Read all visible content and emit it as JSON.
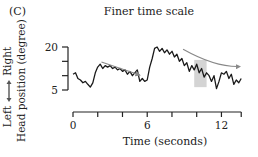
{
  "panel_label": "(C)",
  "chart_data": {
    "type": "line",
    "title": "Finer time scale",
    "xlabel": "Time (seconds)",
    "ylabel": "Head position (degree)",
    "ylabel_direction": {
      "low": "Left",
      "high": "Right"
    },
    "xlim": [
      0,
      13.6
    ],
    "ylim": [
      5,
      20
    ],
    "x_ticks": [
      0,
      2,
      4,
      6,
      8,
      10,
      12
    ],
    "x_tick_labels": [
      "0",
      "",
      "",
      "6",
      "",
      "",
      "12"
    ],
    "y_ticks": [
      5,
      10,
      15,
      20
    ],
    "y_tick_labels": [
      "5",
      "",
      "",
      "20"
    ],
    "grid": false,
    "series": [
      {
        "name": "Head position",
        "color": "#1a1a1a",
        "x": [
          0,
          0.2,
          0.4,
          0.6,
          0.8,
          1.0,
          1.2,
          1.4,
          1.6,
          1.8,
          2.0,
          2.2,
          2.4,
          2.6,
          2.8,
          3.0,
          3.2,
          3.4,
          3.6,
          3.8,
          4.0,
          4.2,
          4.4,
          4.6,
          4.8,
          5.0,
          5.2,
          5.4,
          5.6,
          5.8,
          6.0,
          6.2,
          6.4,
          6.6,
          6.8,
          7.0,
          7.2,
          7.4,
          7.6,
          7.8,
          8.0,
          8.2,
          8.4,
          8.6,
          8.8,
          9.0,
          9.2,
          9.4,
          9.6,
          9.8,
          10.0,
          10.2,
          10.4,
          10.6,
          10.8,
          11.0,
          11.2,
          11.4,
          11.6,
          11.8,
          12.0,
          12.2,
          12.4,
          12.6,
          12.8,
          13.0,
          13.2,
          13.4,
          13.6
        ],
        "values": [
          10.5,
          11,
          9,
          8.5,
          7.5,
          8,
          7,
          6,
          7.5,
          11,
          13,
          14,
          12.5,
          13.5,
          13,
          13.5,
          12.5,
          13,
          12,
          12.5,
          11.5,
          12,
          10.5,
          11.5,
          10,
          11,
          12,
          8,
          9,
          8,
          8.5,
          13,
          16,
          19.5,
          20,
          18.5,
          19.5,
          18,
          19,
          17.5,
          18.5,
          16.5,
          17.5,
          15,
          16,
          13.5,
          14.5,
          11.5,
          13.5,
          12,
          14,
          11,
          12.5,
          9.5,
          11,
          10,
          8,
          10,
          5.5,
          8,
          11,
          10.5,
          11.5,
          9,
          10.5,
          7,
          8.5,
          7.5,
          9
        ]
      }
    ],
    "annotations": [
      {
        "type": "arrow",
        "label": "downward drift 1",
        "from": [
          2.3,
          14.8
        ],
        "to": [
          5.4,
          10.2
        ],
        "color": "#888888"
      },
      {
        "type": "arrow",
        "label": "downward drift 2",
        "from": [
          8.9,
          19.2
        ],
        "to": [
          13.5,
          13.2
        ],
        "color": "#888888",
        "curved": true
      },
      {
        "type": "shaded_region",
        "x": [
          9.8,
          10.8
        ],
        "y": [
          6,
          15.5
        ],
        "color": "#d4d4d4"
      }
    ]
  },
  "colors": {
    "line": "#1a1a1a",
    "axis": "#222222",
    "arrow": "#8a8a8a",
    "shade": "#d6d6d6"
  }
}
